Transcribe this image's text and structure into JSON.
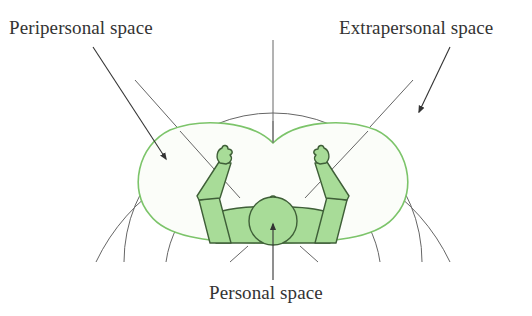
{
  "figure": {
    "labels": {
      "peripersonal": "Peripersonal space",
      "extrapersonal": "Extrapersonal space",
      "personal": "Personal space"
    },
    "colors": {
      "line": "#555555",
      "arrow": "#333333",
      "boundary_green": "#7cc46a",
      "body_fill": "#a8dc98",
      "body_outline": "#3f5f38",
      "region_fill": "#fbfdf9",
      "text": "#333333"
    },
    "regions": [
      {
        "name": "personal-space",
        "description": "body of person lying supine"
      },
      {
        "name": "peripersonal-space",
        "description": "green outlined reachable region around arms"
      },
      {
        "name": "extrapersonal-space",
        "description": "concentric arcs beyond reach"
      }
    ],
    "concentric_arcs": 3
  }
}
